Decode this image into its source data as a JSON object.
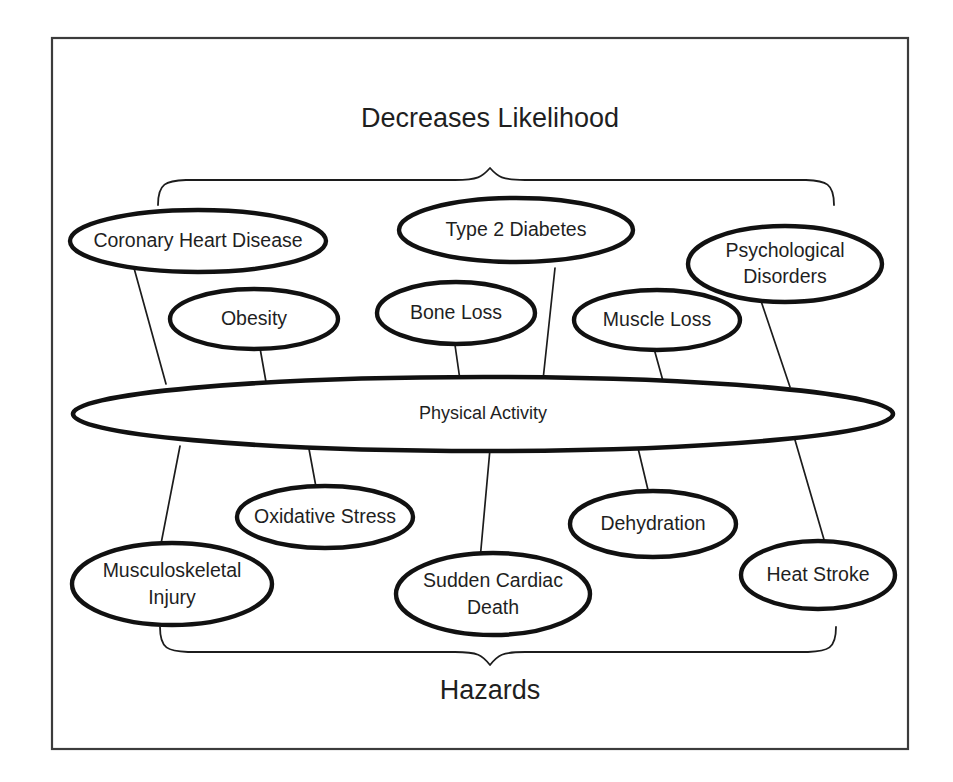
{
  "figure": {
    "frame": {
      "stroke_color": "#3c3c3c"
    },
    "node_stroke_color": "#111111",
    "text_color": "#1f1f1f",
    "background_color": "#ffffff"
  },
  "labels": {
    "top_group": "Decreases Likelihood",
    "bottom_group": "Hazards"
  },
  "hub": {
    "label": "Physical Activity"
  },
  "decreases_likelihood": [
    {
      "id": "coronary-heart-disease",
      "label": "Coronary Heart Disease",
      "lines": [
        "Coronary Heart Disease"
      ]
    },
    {
      "id": "obesity",
      "label": "Obesity",
      "lines": [
        "Obesity"
      ]
    },
    {
      "id": "type-2-diabetes",
      "label": "Type 2 Diabetes",
      "lines": [
        "Type 2 Diabetes"
      ]
    },
    {
      "id": "bone-loss",
      "label": "Bone Loss",
      "lines": [
        "Bone Loss"
      ]
    },
    {
      "id": "muscle-loss",
      "label": "Muscle Loss",
      "lines": [
        "Muscle Loss"
      ]
    },
    {
      "id": "psychological-disorders",
      "label": "Psychological Disorders",
      "lines": [
        "Psychological",
        "Disorders"
      ]
    }
  ],
  "hazards": [
    {
      "id": "musculoskeletal-injury",
      "label": "Musculoskeletal Injury",
      "lines": [
        "Musculoskeletal",
        "Injury"
      ]
    },
    {
      "id": "oxidative-stress",
      "label": "Oxidative Stress",
      "lines": [
        "Oxidative Stress"
      ]
    },
    {
      "id": "sudden-cardiac-death",
      "label": "Sudden Cardiac Death",
      "lines": [
        "Sudden Cardiac",
        "Death"
      ]
    },
    {
      "id": "dehydration",
      "label": "Dehydration",
      "lines": [
        "Dehydration"
      ]
    },
    {
      "id": "heat-stroke",
      "label": "Heat Stroke",
      "lines": [
        "Heat Stroke"
      ]
    }
  ]
}
